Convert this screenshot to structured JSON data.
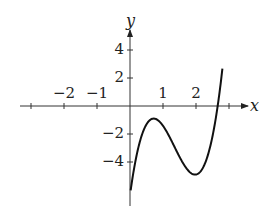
{
  "chart_data": {
    "type": "line",
    "title": "",
    "xlabel": "x",
    "ylabel": "y",
    "xlim": [
      -3,
      3.3
    ],
    "ylim": [
      -7,
      5.5
    ],
    "grid": false,
    "x_ticks": [
      -3,
      -2,
      -1,
      1,
      2,
      3
    ],
    "x_tick_labels": [
      "-2",
      "-1",
      "1",
      "2"
    ],
    "x_tick_label_values": [
      -2,
      -1,
      1,
      2
    ],
    "y_tick_labels": [
      "4",
      "2",
      "-2",
      "-4"
    ],
    "y_tick_label_values": [
      4,
      2,
      -2,
      -4
    ],
    "series": [
      {
        "name": "cubic curve",
        "description": "Cubic with local maximum near (0.72, -0.9), local minimum near (1.97, -4.9), root near x≈2.7",
        "x": [
          0.05,
          0.2,
          0.4,
          0.6,
          0.72,
          0.9,
          1.1,
          1.3,
          1.5,
          1.7,
          1.97,
          2.2,
          2.4,
          2.6,
          2.8
        ],
        "y": [
          -5.6,
          -3.6,
          -1.9,
          -1.0,
          -0.9,
          -1.2,
          -2.1,
          -3.1,
          -4.0,
          -4.6,
          -4.9,
          -4.5,
          -3.2,
          -0.9,
          2.7
        ]
      }
    ]
  },
  "labels": {
    "x_axis": "x",
    "y_axis": "y",
    "xticks": [
      "−2",
      "−1",
      "1",
      "2"
    ],
    "yticks": [
      "4",
      "2",
      "−2",
      "−4"
    ]
  }
}
